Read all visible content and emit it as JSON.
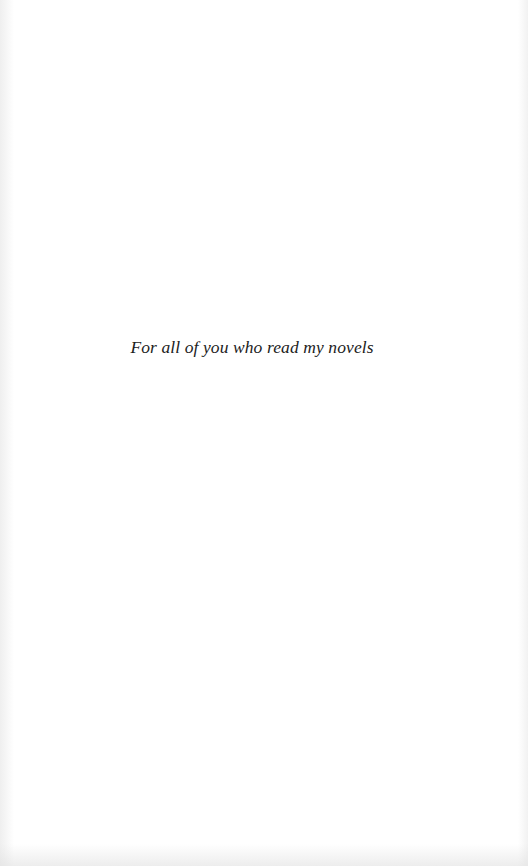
{
  "page": {
    "type": "dedication",
    "dedication_text": "For all of you who read my novels",
    "background_color": "#ffffff",
    "text_color": "#1c1c1c"
  }
}
